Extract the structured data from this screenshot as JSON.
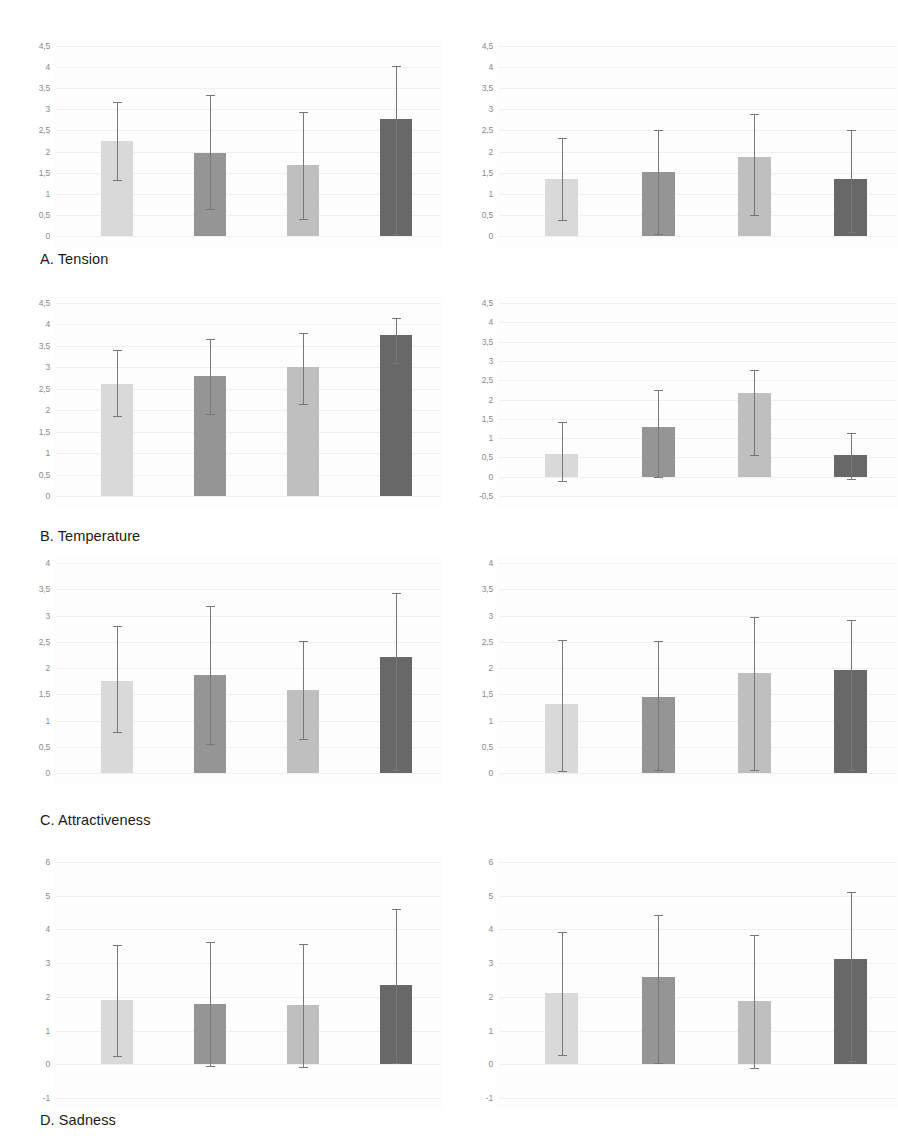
{
  "figure": {
    "caption_prefix": "",
    "background_color": "#ffffff",
    "series_colors": [
      "#d9d9d9",
      "#959595",
      "#bfbfbf",
      "#686868"
    ],
    "series_names": [
      "condition-1",
      "condition-2",
      "condition-3",
      "condition-4"
    ],
    "errorbar_color": "#777777",
    "gridline_color": "#f0f0f0",
    "axis_text_color": "#8a8a8a",
    "caption_text_color": "#1a1a1a"
  },
  "panels": [
    {
      "id": "A",
      "caption": "A. Tension",
      "charts": [
        {
          "side": "left",
          "ticks": [
            "4,5",
            "4",
            "3,5",
            "3",
            "2,5",
            "2",
            "1,5",
            "1",
            "0,5",
            "0"
          ],
          "tick_values": [
            4.5,
            4,
            3.5,
            3,
            2.5,
            2,
            1.5,
            1,
            0.5,
            0
          ],
          "ymin": 0,
          "ymax": 4.5,
          "values": [
            2.25,
            1.97,
            1.67,
            2.77
          ],
          "err_low": [
            1.32,
            0.63,
            0.4,
            0.05
          ],
          "err_high": [
            3.17,
            3.33,
            2.93,
            4.02
          ]
        },
        {
          "side": "right",
          "ticks": [
            "4,5",
            "4",
            "3,5",
            "3",
            "2,5",
            "2",
            "1,5",
            "1",
            "0,5",
            "0"
          ],
          "tick_values": [
            4.5,
            4,
            3.5,
            3,
            2.5,
            2,
            1.5,
            1,
            0.5,
            0
          ],
          "ymin": 0,
          "ymax": 4.5,
          "values": [
            1.36,
            1.52,
            1.88,
            1.34
          ],
          "err_low": [
            0.37,
            0.05,
            0.5,
            0.1
          ],
          "err_high": [
            2.32,
            2.5,
            2.9,
            2.52
          ]
        }
      ]
    },
    {
      "id": "B",
      "caption": "B. Temperature",
      "charts": [
        {
          "side": "left",
          "ticks": [
            "4,5",
            "4",
            "3,5",
            "3",
            "2,5",
            "2",
            "1,5",
            "1",
            "0,5",
            "0"
          ],
          "tick_values": [
            4.5,
            4,
            3.5,
            3,
            2.5,
            2,
            1.5,
            1,
            0.5,
            0
          ],
          "ymin": 0,
          "ymax": 4.5,
          "values": [
            2.6,
            2.79,
            3.01,
            3.76
          ],
          "err_low": [
            1.87,
            1.92,
            2.15,
            3.1
          ],
          "err_high": [
            3.4,
            3.66,
            3.8,
            4.15
          ]
        },
        {
          "side": "right",
          "ticks": [
            "4,5",
            "4",
            "3,5",
            "3",
            "2,5",
            "2",
            "1,5",
            "1",
            "0,5",
            "0",
            "-0,5"
          ],
          "tick_values": [
            4.5,
            4,
            3.5,
            3,
            2.5,
            2,
            1.5,
            1,
            0.5,
            0,
            -0.5
          ],
          "ymin": -0.5,
          "ymax": 4.5,
          "values": [
            0.6,
            1.3,
            2.17,
            0.55
          ],
          "err_low": [
            -0.12,
            0.0,
            0.55,
            -0.05
          ],
          "err_high": [
            1.42,
            2.25,
            2.77,
            1.12
          ]
        }
      ]
    },
    {
      "id": "C",
      "caption": "C. Attractiveness",
      "charts": [
        {
          "side": "left",
          "ticks": [
            "4",
            "3,5",
            "3",
            "2,5",
            "2",
            "1,5",
            "1",
            "0,5",
            "0"
          ],
          "tick_values": [
            4,
            3.5,
            3,
            2.5,
            2,
            1.5,
            1,
            0.5,
            0
          ],
          "ymin": 0,
          "ymax": 4,
          "values": [
            1.76,
            1.87,
            1.58,
            2.21
          ],
          "err_low": [
            0.78,
            0.55,
            0.65,
            0.05
          ],
          "err_high": [
            2.8,
            3.18,
            2.52,
            3.42
          ]
        },
        {
          "side": "right",
          "ticks": [
            "4",
            "3,5",
            "3",
            "2,5",
            "2",
            "1,5",
            "1",
            "0,5",
            "0"
          ],
          "tick_values": [
            4,
            3.5,
            3,
            2.5,
            2,
            1.5,
            1,
            0.5,
            0
          ],
          "ymin": 0,
          "ymax": 4,
          "values": [
            1.31,
            1.44,
            1.9,
            1.96
          ],
          "err_low": [
            0.03,
            0.05,
            0.05,
            0.05
          ],
          "err_high": [
            2.53,
            2.52,
            2.98,
            2.92
          ]
        }
      ]
    },
    {
      "id": "D",
      "caption": "D. Sadness",
      "charts": [
        {
          "side": "left",
          "ticks": [
            "6",
            "5",
            "4",
            "3",
            "2",
            "1",
            "0",
            "-1"
          ],
          "tick_values": [
            6,
            5,
            4,
            3,
            2,
            1,
            0,
            -1
          ],
          "ymin": -1,
          "ymax": 6,
          "values": [
            1.9,
            1.8,
            1.75,
            2.35
          ],
          "err_low": [
            0.25,
            -0.05,
            -0.08,
            0.05
          ],
          "err_high": [
            3.55,
            3.62,
            3.57,
            4.62
          ]
        },
        {
          "side": "right",
          "ticks": [
            "6",
            "5",
            "4",
            "3",
            "2",
            "1",
            "0",
            "-1"
          ],
          "tick_values": [
            6,
            5,
            4,
            3,
            2,
            1,
            0,
            -1
          ],
          "ymin": -1,
          "ymax": 6,
          "values": [
            2.1,
            2.6,
            1.88,
            3.12
          ],
          "err_low": [
            0.28,
            0.05,
            -0.1,
            0.1
          ],
          "err_high": [
            3.92,
            4.42,
            3.82,
            5.12
          ]
        }
      ]
    }
  ],
  "chart_data": {
    "type": "bar",
    "title": "",
    "xlabel": "",
    "ylabel": "",
    "grid": true,
    "legend_position": "none",
    "categories": [
      "condition-1",
      "condition-2",
      "condition-3",
      "condition-4"
    ],
    "panels": [
      {
        "panel": "A. Tension",
        "subplot": "left",
        "ylim": [
          0,
          4.5
        ],
        "yticks": [
          0,
          0.5,
          1,
          1.5,
          2,
          2.5,
          3,
          3.5,
          4,
          4.5
        ],
        "values": [
          2.25,
          1.97,
          1.67,
          2.77
        ],
        "error_low": [
          1.32,
          0.63,
          0.4,
          0.05
        ],
        "error_high": [
          3.17,
          3.33,
          2.93,
          4.02
        ]
      },
      {
        "panel": "A. Tension",
        "subplot": "right",
        "ylim": [
          0,
          4.5
        ],
        "yticks": [
          0,
          0.5,
          1,
          1.5,
          2,
          2.5,
          3,
          3.5,
          4,
          4.5
        ],
        "values": [
          1.36,
          1.52,
          1.88,
          1.34
        ],
        "error_low": [
          0.37,
          0.05,
          0.5,
          0.1
        ],
        "error_high": [
          2.32,
          2.5,
          2.9,
          2.52
        ]
      },
      {
        "panel": "B. Temperature",
        "subplot": "left",
        "ylim": [
          0,
          4.5
        ],
        "yticks": [
          0,
          0.5,
          1,
          1.5,
          2,
          2.5,
          3,
          3.5,
          4,
          4.5
        ],
        "values": [
          2.6,
          2.79,
          3.01,
          3.76
        ],
        "error_low": [
          1.87,
          1.92,
          2.15,
          3.1
        ],
        "error_high": [
          3.4,
          3.66,
          3.8,
          4.15
        ]
      },
      {
        "panel": "B. Temperature",
        "subplot": "right",
        "ylim": [
          -0.5,
          4.5
        ],
        "yticks": [
          -0.5,
          0,
          0.5,
          1,
          1.5,
          2,
          2.5,
          3,
          3.5,
          4,
          4.5
        ],
        "values": [
          0.6,
          1.3,
          2.17,
          0.55
        ],
        "error_low": [
          -0.12,
          0.0,
          0.55,
          -0.05
        ],
        "error_high": [
          1.42,
          2.25,
          2.77,
          1.12
        ]
      },
      {
        "panel": "C. Attractiveness",
        "subplot": "left",
        "ylim": [
          0,
          4
        ],
        "yticks": [
          0,
          0.5,
          1,
          1.5,
          2,
          2.5,
          3,
          3.5,
          4
        ],
        "values": [
          1.76,
          1.87,
          1.58,
          2.21
        ],
        "error_low": [
          0.78,
          0.55,
          0.65,
          0.05
        ],
        "error_high": [
          2.8,
          3.18,
          2.52,
          3.42
        ]
      },
      {
        "panel": "C. Attractiveness",
        "subplot": "right",
        "ylim": [
          0,
          4
        ],
        "yticks": [
          0,
          0.5,
          1,
          1.5,
          2,
          2.5,
          3,
          3.5,
          4
        ],
        "values": [
          1.31,
          1.44,
          1.9,
          1.96
        ],
        "error_low": [
          0.03,
          0.05,
          0.05,
          0.05
        ],
        "error_high": [
          2.53,
          2.52,
          2.98,
          2.92
        ]
      },
      {
        "panel": "D. Sadness",
        "subplot": "left",
        "ylim": [
          -1,
          6
        ],
        "yticks": [
          -1,
          0,
          1,
          2,
          3,
          4,
          5,
          6
        ],
        "values": [
          1.9,
          1.8,
          1.75,
          2.35
        ],
        "error_low": [
          0.25,
          -0.05,
          -0.08,
          0.05
        ],
        "error_high": [
          3.55,
          3.62,
          3.57,
          4.62
        ]
      },
      {
        "panel": "D. Sadness",
        "subplot": "right",
        "ylim": [
          -1,
          6
        ],
        "yticks": [
          -1,
          0,
          1,
          2,
          3,
          4,
          5,
          6
        ],
        "values": [
          2.1,
          2.6,
          1.88,
          3.12
        ],
        "error_low": [
          0.28,
          0.05,
          -0.1,
          0.1
        ],
        "error_high": [
          3.92,
          4.42,
          3.82,
          5.12
        ]
      }
    ]
  }
}
